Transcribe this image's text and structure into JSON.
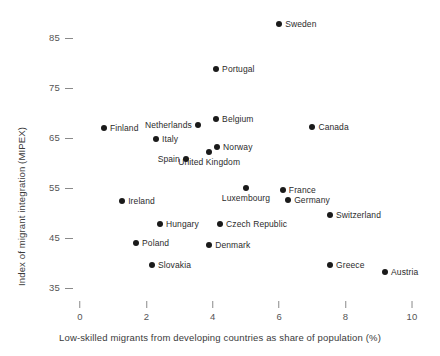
{
  "chart_data": {
    "type": "scatter",
    "title": "",
    "xlabel": "Low-skilled migrants from developing countries as share of population (%)",
    "ylabel": "Index of migrant integration (MIPEX)",
    "xlim": [
      0,
      10
    ],
    "ylim": [
      33,
      89
    ],
    "xticks": [
      0,
      2,
      4,
      6,
      8,
      10
    ],
    "yticks": [
      35,
      45,
      55,
      65,
      75,
      85
    ],
    "xtick_labels": [
      "0",
      "2",
      "4",
      "6",
      "8",
      "10"
    ],
    "ytick_labels": [
      "35",
      "45",
      "55",
      "65",
      "75",
      "85"
    ],
    "grid": false,
    "legend": "none",
    "marker_color": "#1a1a1a",
    "points": [
      {
        "label": "Sweden",
        "x": 6.0,
        "y": 87.8,
        "label_pos": "right"
      },
      {
        "label": "Portugal",
        "x": 4.1,
        "y": 78.8,
        "label_pos": "right"
      },
      {
        "label": "Belgium",
        "x": 4.1,
        "y": 68.8,
        "label_pos": "right"
      },
      {
        "label": "Netherlands",
        "x": 3.55,
        "y": 67.6,
        "label_pos": "left"
      },
      {
        "label": "Canada",
        "x": 7.0,
        "y": 67.2,
        "label_pos": "right"
      },
      {
        "label": "Finland",
        "x": 0.72,
        "y": 67.0,
        "label_pos": "right"
      },
      {
        "label": "Italy",
        "x": 2.29,
        "y": 64.8,
        "label_pos": "right"
      },
      {
        "label": "Norway",
        "x": 4.13,
        "y": 63.2,
        "label_pos": "right"
      },
      {
        "label": "United Kingdom",
        "x": 3.89,
        "y": 62.2,
        "label_pos": "below"
      },
      {
        "label": "Spain",
        "x": 3.19,
        "y": 60.8,
        "label_pos": "left"
      },
      {
        "label": "Luxembourg",
        "x": 5.0,
        "y": 55.0,
        "label_pos": "below"
      },
      {
        "label": "France",
        "x": 6.11,
        "y": 54.6,
        "label_pos": "right"
      },
      {
        "label": "Germany",
        "x": 6.27,
        "y": 52.6,
        "label_pos": "right"
      },
      {
        "label": "Ireland",
        "x": 1.27,
        "y": 52.4,
        "label_pos": "right"
      },
      {
        "label": "Switzerland",
        "x": 7.53,
        "y": 49.6,
        "label_pos": "right"
      },
      {
        "label": "Hungary",
        "x": 2.41,
        "y": 47.8,
        "label_pos": "right"
      },
      {
        "label": "Czech Republic",
        "x": 4.22,
        "y": 47.8,
        "label_pos": "right"
      },
      {
        "label": "Poland",
        "x": 1.69,
        "y": 44.0,
        "label_pos": "right"
      },
      {
        "label": "Denmark",
        "x": 3.89,
        "y": 43.6,
        "label_pos": "right"
      },
      {
        "label": "Slovakia",
        "x": 2.17,
        "y": 39.6,
        "label_pos": "right"
      },
      {
        "label": "Greece",
        "x": 7.53,
        "y": 39.6,
        "label_pos": "right"
      },
      {
        "label": "Austria",
        "x": 9.19,
        "y": 38.2,
        "label_pos": "right"
      }
    ]
  }
}
